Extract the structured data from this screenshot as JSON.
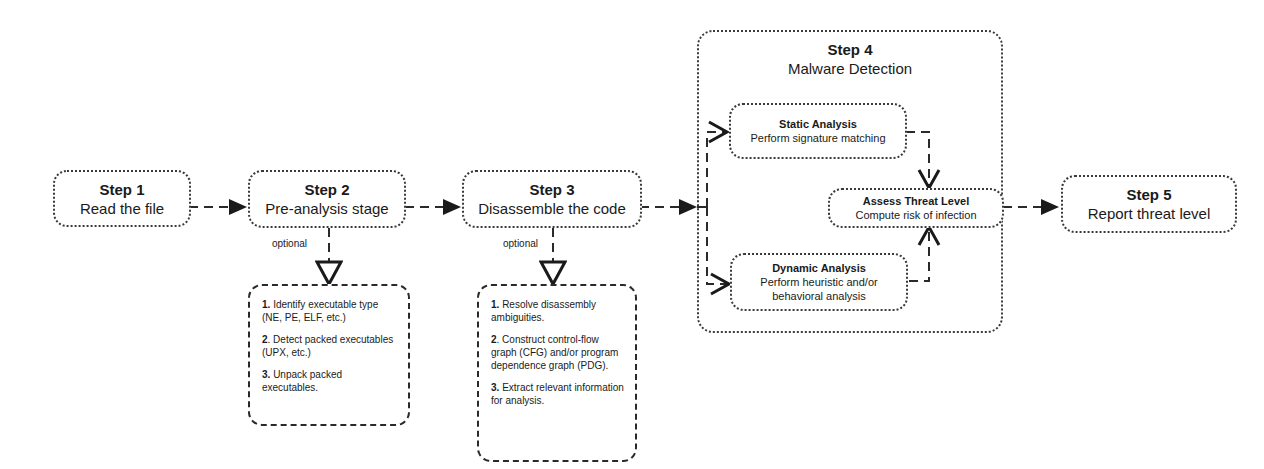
{
  "diagram": {
    "steps": [
      {
        "title": "Step 1",
        "subtitle": "Read the file"
      },
      {
        "title": "Step 2",
        "subtitle": "Pre-analysis stage"
      },
      {
        "title": "Step 3",
        "subtitle": "Disassemble the code"
      },
      {
        "title": "Step 4",
        "subtitle": "Malware Detection"
      },
      {
        "title": "Step 5",
        "subtitle": "Report threat level"
      }
    ],
    "step4_nodes": {
      "static": {
        "title": "Static Analysis",
        "desc": "Perform signature matching"
      },
      "assess": {
        "title": "Assess Threat Level",
        "desc": "Compute risk of infection"
      },
      "dynamic": {
        "title": "Dynamic Analysis",
        "desc1": "Perform heuristic and/or",
        "desc2": "behavioral analysis"
      }
    },
    "optional_label": "optional",
    "step2_options": [
      {
        "num": "1.",
        "text": "Identify executable type (NE, PE, ELF, etc.)"
      },
      {
        "num": "2",
        "text": ". Detect packed executables (UPX, etc.)"
      },
      {
        "num": "3.",
        "text": "Unpack packed executables."
      }
    ],
    "step3_options": [
      {
        "num": "1.",
        "text": "Resolve disassembly ambiguities."
      },
      {
        "num": "2",
        "text": ". Construct control-flow graph (CFG) and/or program dependence graph (PDG)."
      },
      {
        "num": "3.",
        "text": "Extract relevant information for analysis."
      }
    ]
  }
}
